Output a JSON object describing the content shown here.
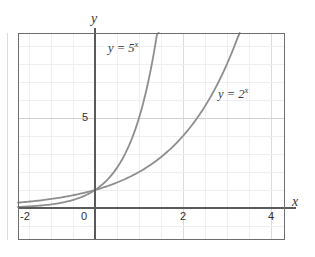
{
  "chart_data": {
    "type": "line",
    "title": "",
    "xlabel": "x",
    "ylabel": "y",
    "xlim": [
      -2.75,
      4.35
    ],
    "ylim": [
      -1.8,
      9.7
    ],
    "grid": true,
    "legend": "inline-labels",
    "x_ticks": [
      {
        "value": -2,
        "label": "-2"
      },
      {
        "value": 0,
        "label": "0"
      },
      {
        "value": 2,
        "label": "2"
      },
      {
        "value": 4,
        "label": "4"
      }
    ],
    "y_ticks": [
      {
        "value": 5,
        "label": "5"
      }
    ],
    "series": [
      {
        "name": "y = 5^x",
        "label_html": "y = 5<sup>x</sup>",
        "base": 5,
        "color": "#8e8e8e",
        "x": [
          -2.75,
          -2.5,
          -2.25,
          -2,
          -1.75,
          -1.5,
          -1.25,
          -1,
          -0.75,
          -0.5,
          -0.25,
          0,
          0.25,
          0.5,
          0.75,
          1,
          1.25,
          1.42
        ],
        "y": [
          0.022,
          0.036,
          0.054,
          0.04,
          0.062,
          0.089,
          0.134,
          0.2,
          0.299,
          0.447,
          0.669,
          1,
          1.495,
          2.236,
          3.344,
          5,
          7.476,
          9.7
        ]
      },
      {
        "name": "y = 2^x",
        "label_html": "y = 2<sup>x</sup>",
        "base": 2,
        "color": "#8e8e8e",
        "x": [
          -2.75,
          -2.5,
          -2.25,
          -2,
          -1.75,
          -1.5,
          -1.25,
          -1,
          -0.75,
          -0.5,
          -0.25,
          0,
          0.5,
          1,
          1.5,
          2,
          2.5,
          3,
          3.14
        ],
        "y": [
          0.149,
          0.177,
          0.21,
          0.25,
          0.297,
          0.354,
          0.42,
          0.5,
          0.595,
          0.707,
          0.841,
          1,
          1.414,
          2,
          2.828,
          4,
          5.657,
          8,
          8.8
        ]
      }
    ],
    "colors": {
      "background": "#ffffff",
      "frame": "#6e6e6e",
      "axis": "#5a5a5a",
      "grid_minor": "#eceef1",
      "grid_major": "#d8dade",
      "curve": "#8e8e8e",
      "text": "#2f2f2f"
    }
  }
}
